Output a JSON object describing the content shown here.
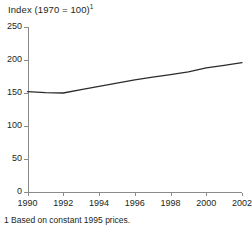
{
  "chart_data": {
    "type": "line",
    "title": "Index (1970 = 100)",
    "title_superscript": "1",
    "xlabel": "",
    "ylabel": "",
    "xlim": [
      1990,
      2002
    ],
    "ylim": [
      0,
      250
    ],
    "grid": false,
    "legend": "none",
    "x_ticks": [
      1990,
      1992,
      1994,
      1996,
      1998,
      2000,
      2002
    ],
    "x_tick_labels": [
      "1990",
      "1992",
      "1994",
      "1996",
      "1998",
      "2000",
      "2002"
    ],
    "y_ticks": [
      0,
      50,
      100,
      150,
      200,
      250
    ],
    "y_tick_labels": [
      "0",
      "50",
      "100",
      "150",
      "200",
      "250"
    ],
    "series": [
      {
        "name": "Index",
        "color": "#2b2b2b",
        "x": [
          1990,
          1991,
          1992,
          1993,
          1994,
          1995,
          1996,
          1997,
          1998,
          1999,
          2000,
          2001,
          2002
        ],
        "values": [
          152,
          150.5,
          150,
          155,
          160,
          165,
          170,
          174,
          178,
          182,
          188,
          192,
          196
        ]
      }
    ],
    "footnote": "1 Based on constant 1995 prices.",
    "axis_color": "#8a8a8a"
  }
}
